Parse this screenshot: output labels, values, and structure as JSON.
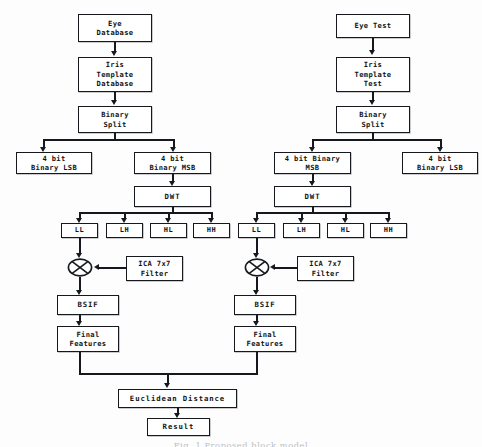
{
  "figure": {
    "caption": "Fig. 1  Proposed block model"
  },
  "enroll_branch": {
    "source": "Eye\nDatabase",
    "template": "Iris\nTemplate\nDatabase",
    "split": "Binary\nSplit",
    "lsb": "4 bit\nBinary LSB",
    "msb": "4 bit\nBinary MSB",
    "dwt": "DWT",
    "subbands": [
      "LL",
      "LH",
      "HL",
      "HH"
    ],
    "filter": "ICA 7x7\nFilter",
    "operator": "multiply-operator",
    "bsif": "BSIF",
    "features": "Final\nFeatures"
  },
  "test_branch": {
    "source": "Eye Test",
    "template": "Iris\nTemplate\nTest",
    "split": "Binary\nSplit",
    "msb": "4 bit Binary\nMSB",
    "lsb": "4 bit\nBinary LSB",
    "dwt": "DWT",
    "subbands": [
      "LL",
      "LH",
      "HL",
      "HH"
    ],
    "filter": "ICA 7x7\nFilter",
    "operator": "multiply-operator",
    "bsif": "BSIF",
    "features": "Final\nFeatures"
  },
  "matching": {
    "distance": "Euclidean Distance",
    "result": "Result"
  },
  "colors": {
    "ink": "#15181c",
    "box_fill": "#ffffff",
    "background": "#fdfdfd",
    "caption": "#b9bcc0"
  }
}
